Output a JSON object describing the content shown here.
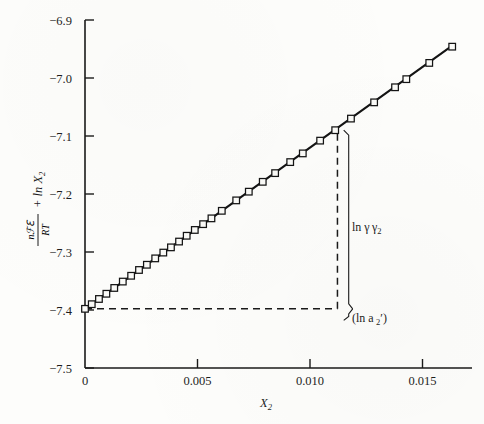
{
  "chart_data": {
    "type": "scatter",
    "title": "",
    "xlabel": "X_2",
    "xlabel_base": "X",
    "xlabel_sub": "2",
    "ylabel": "nℱℇ/RT + ln X_2",
    "ylabel_fraction_numerator": "nℱℇ",
    "ylabel_fraction_denominator": "RT",
    "ylabel_suffix": "+ ln X",
    "ylabel_suffix_sub": "2",
    "xlim": [
      0,
      0.0172
    ],
    "ylim": [
      -7.5,
      -6.9
    ],
    "xticks": [
      0,
      0.005,
      0.01,
      0.015
    ],
    "xtick_labels": [
      "0",
      "0.005",
      "0.010",
      "0.015"
    ],
    "yticks": [
      -6.9,
      -7.0,
      -7.1,
      -7.2,
      -7.3,
      -7.4,
      -7.5
    ],
    "ytick_labels": [
      "−6.9",
      "−7.0",
      "−7.1",
      "−7.2",
      "−7.3",
      "−7.4",
      "−7.5"
    ],
    "grid": false,
    "legend": "none",
    "marker": "open-square",
    "line_color": "#141414",
    "marker_color": "#141414",
    "fit_line": {
      "intercept": -7.398,
      "slope": 27.8,
      "x_start": 0,
      "x_end": 0.0164
    },
    "x": [
      0.0,
      0.0003,
      0.00062,
      0.00095,
      0.0013,
      0.00168,
      0.00205,
      0.0024,
      0.00275,
      0.00312,
      0.00348,
      0.00382,
      0.00418,
      0.00452,
      0.00488,
      0.00525,
      0.00562,
      0.00608,
      0.00672,
      0.00728,
      0.0079,
      0.00845,
      0.00912,
      0.00968,
      0.01045,
      0.01112,
      0.01182,
      0.01285,
      0.01378,
      0.01428,
      0.0153,
      0.01632
    ],
    "y": [
      -7.398,
      -7.39,
      -7.381,
      -7.372,
      -7.362,
      -7.351,
      -7.341,
      -7.331,
      -7.322,
      -7.311,
      -7.301,
      -7.292,
      -7.282,
      -7.272,
      -7.262,
      -7.252,
      -7.242,
      -7.229,
      -7.211,
      -7.196,
      -7.179,
      -7.164,
      -7.145,
      -7.13,
      -7.108,
      -7.09,
      -7.07,
      -7.042,
      -7.016,
      -7.002,
      -6.974,
      -6.946
    ],
    "annotations": [
      {
        "name": "ln-gamma-2",
        "text": "ln γ",
        "sub": "2",
        "x": 0.0126,
        "y": -7.24
      },
      {
        "name": "ln-a-2-prime",
        "text": "(ln a",
        "sub": "2",
        "prime": "′",
        "close": ")",
        "x": 0.0126,
        "y": -7.398
      }
    ],
    "construction_lines": {
      "horizontal_dashed": {
        "y": -7.398,
        "x_from": 0.0,
        "x_to": 0.01122
      },
      "vertical_dashed": {
        "x": 0.01122,
        "y_from": -7.398,
        "y_to": -7.09
      },
      "brace_x": 0.01172,
      "brace_top": -7.09,
      "brace_mid": -7.398,
      "brace_bottom": -7.418
    }
  }
}
